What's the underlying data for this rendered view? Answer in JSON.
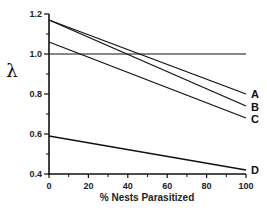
{
  "chart_data": {
    "type": "line",
    "title": "",
    "xlabel": "% Nests Parasitized",
    "ylabel": "λ",
    "xlim": [
      0,
      100
    ],
    "ylim": [
      0.4,
      1.2
    ],
    "x_ticks": [
      0,
      20,
      40,
      60,
      80,
      100
    ],
    "x_minor_ticks": [
      10,
      30,
      50,
      70,
      90
    ],
    "y_ticks": [
      0.4,
      0.6,
      0.8,
      1.0,
      1.2
    ],
    "y_tick_labels": [
      "0.4",
      "0.6",
      "0.8",
      "1.0",
      "1.2"
    ],
    "y_minor_ticks": [
      0.5,
      0.7,
      0.9,
      1.1
    ],
    "grid": false,
    "legend": "inline labels at right end of lines",
    "reference_lines": [
      {
        "orientation": "horizontal",
        "y": 1.0
      }
    ],
    "x": [
      0,
      100
    ],
    "series": [
      {
        "name": "A",
        "values": [
          1.17,
          0.8
        ]
      },
      {
        "name": "B",
        "values": [
          1.17,
          0.74
        ]
      },
      {
        "name": "C",
        "values": [
          1.06,
          0.68
        ]
      },
      {
        "name": "D",
        "values": [
          0.59,
          0.42
        ]
      }
    ]
  },
  "colors": {
    "line": "#111111",
    "axis": "#111111",
    "background": "#ffffff"
  }
}
